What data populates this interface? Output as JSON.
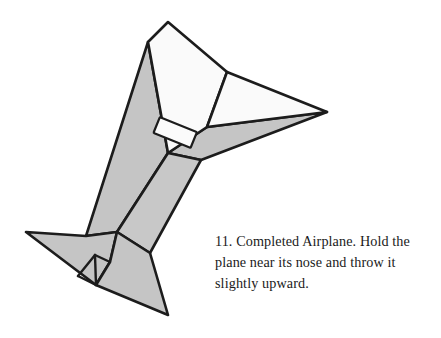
{
  "figure": {
    "step_number": "11",
    "colors": {
      "paper_light": "#fafafa",
      "paper_shaded": "#c5c5c5",
      "paper_shaded_alt": "#c8c8c8",
      "outline": "#1c1c1c",
      "background": "#ffffff"
    },
    "stroke_width": "2.6",
    "parts": [
      {
        "name": "upper-white-panel",
        "shade": "light"
      },
      {
        "name": "right-wing-white-panel",
        "shade": "light"
      },
      {
        "name": "left-wing-shaded-panel",
        "shade": "shaded"
      },
      {
        "name": "right-wing-shaded-underside",
        "shade": "shaded"
      },
      {
        "name": "fuselage-shaded-panel",
        "shade": "shaded"
      },
      {
        "name": "tail-left-shaded-fin",
        "shade": "shaded"
      },
      {
        "name": "tail-lower-shaded-fin",
        "shade": "shaded"
      },
      {
        "name": "tape-clip",
        "shade": "light"
      }
    ]
  },
  "caption": {
    "lines": [
      "11. Completed Airplane. Hold the",
      "plane near its nose and throw it",
      "slightly upward."
    ],
    "full_text": "11. Completed Airplane. Hold the plane near its nose and throw it slightly upward."
  }
}
